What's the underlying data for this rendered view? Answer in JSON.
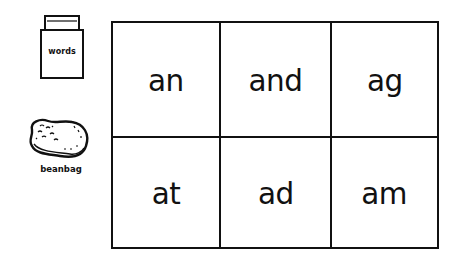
{
  "legend": {
    "words_card": {
      "label": "words",
      "icon": "word-card-stack-icon"
    },
    "beanbag": {
      "label": "beanbag",
      "icon": "beanbag-icon"
    }
  },
  "grid": {
    "rows": 2,
    "columns": 3,
    "cells": [
      [
        "an",
        "and",
        "ag"
      ],
      [
        "at",
        "ad",
        "am"
      ]
    ]
  }
}
